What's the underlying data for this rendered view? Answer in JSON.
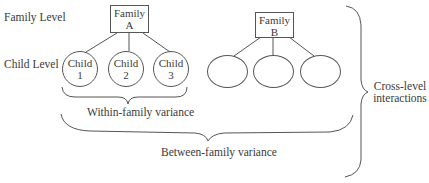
{
  "levels": {
    "family_level": "Family Level",
    "child_level": "Child Level"
  },
  "families": [
    {
      "line1": "Family",
      "line2": "A",
      "children": [
        {
          "line1": "Child",
          "line2": "1"
        },
        {
          "line1": "Child",
          "line2": "2"
        },
        {
          "line1": "Child",
          "line2": "3"
        }
      ]
    },
    {
      "line1": "Family",
      "line2": "B",
      "children": [
        {
          "line1": "",
          "line2": ""
        },
        {
          "line1": "",
          "line2": ""
        },
        {
          "line1": "",
          "line2": ""
        }
      ]
    }
  ],
  "braces": {
    "within_family": "Within-family variance",
    "between_family": "Between-family variance",
    "cross_level_line1": "Cross-level",
    "cross_level_line2": "interactions"
  },
  "colors": {
    "stroke": "#555555",
    "text": "#3a3a3a",
    "background": "#ffffff"
  }
}
